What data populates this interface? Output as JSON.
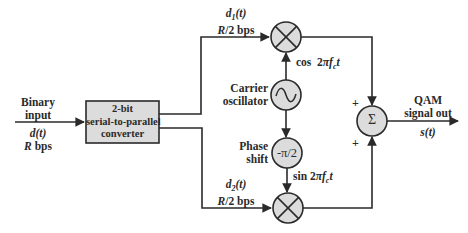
{
  "diagram": {
    "input": {
      "label_line1": "Binary",
      "label_line2": "input",
      "signal": "d(t)",
      "rate": "R bps"
    },
    "converter": {
      "line1": "2-bit",
      "line2": "serial-to-parallel",
      "line3": "converter"
    },
    "branch_top": {
      "signal": "d1(t)",
      "signal_main": "d",
      "signal_sub": "1",
      "signal_rest": "(t)",
      "rate": "R/2 bps"
    },
    "branch_bottom": {
      "signal": "d2(t)",
      "signal_main": "d",
      "signal_sub": "2",
      "signal_rest": "(t)",
      "rate": "R/2 bps"
    },
    "oscillator": {
      "line1": "Carrier",
      "line2": "oscillator",
      "symbol": "~"
    },
    "phase_shift": {
      "line1": "Phase",
      "line2": "shift",
      "symbol": "-π/2"
    },
    "carrier_cos": "cos 2πfct",
    "carrier_sin": "sin 2πfct",
    "summer": {
      "symbol": "Σ",
      "plus_top": "+",
      "plus_bottom": "+"
    },
    "output": {
      "line1": "QAM",
      "line2": "signal out",
      "signal": "s(t)"
    }
  },
  "colors": {
    "stroke": "#2a2a2a",
    "fill": "#dcdcdc",
    "background": "#ffffff"
  }
}
